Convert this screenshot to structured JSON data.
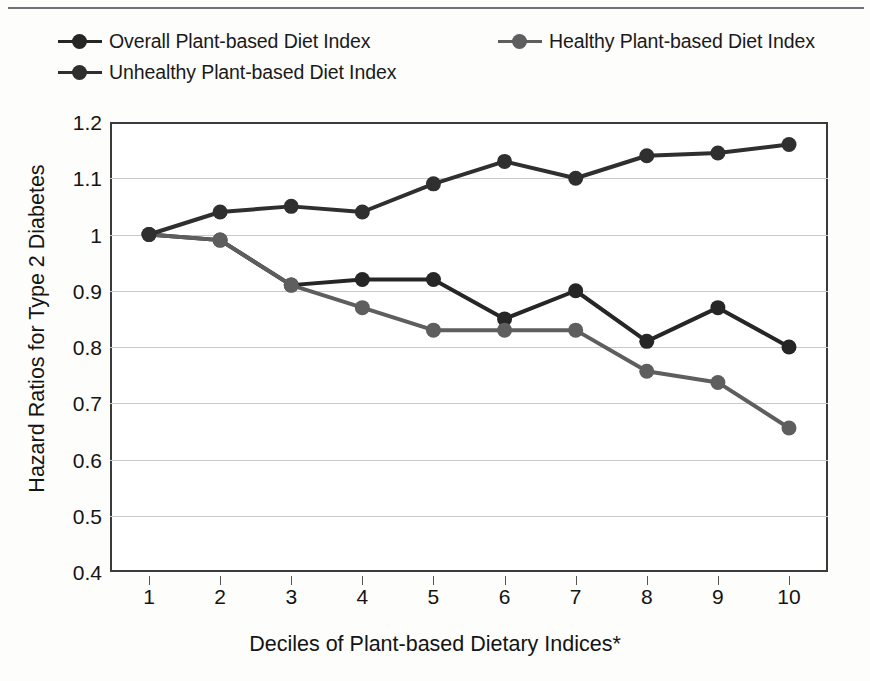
{
  "figure": {
    "has_top_rule": true,
    "background": "#fdfdfc"
  },
  "legend": {
    "items": [
      {
        "label": "Overall Plant-based Diet Index",
        "color": "#262626",
        "marker": "circle-marker-overall"
      },
      {
        "label": "Healthy Plant-based Diet Index",
        "color": "#5e5e5e",
        "marker": "circle-marker-healthy"
      },
      {
        "label": "Unhealthy Plant-based Diet Index",
        "color": "#2f2f2f",
        "marker": "circle-marker-unhealthy"
      }
    ]
  },
  "axes": {
    "y_ticks": [
      "1.2",
      "1.1",
      "1",
      "0.9",
      "0.8",
      "0.7",
      "0.6",
      "0.5",
      "0.4"
    ],
    "x_ticks": [
      "1",
      "2",
      "3",
      "4",
      "5",
      "6",
      "7",
      "8",
      "9",
      "10"
    ],
    "x_title": "Deciles of Plant-based Dietary Indices*",
    "y_title": "Hazard Ratios for Type 2 Diabetes"
  },
  "chart_data": {
    "type": "line",
    "title": "",
    "xlabel": "Deciles of Plant-based Dietary Indices*",
    "ylabel": "Hazard Ratios for Type 2 Diabetes",
    "x": [
      1,
      2,
      3,
      4,
      5,
      6,
      7,
      8,
      9,
      10
    ],
    "categories": [
      "1",
      "2",
      "3",
      "4",
      "5",
      "6",
      "7",
      "8",
      "9",
      "10"
    ],
    "xlim": [
      1,
      10
    ],
    "ylim": [
      0.4,
      1.2
    ],
    "y_ticks": [
      0.4,
      0.5,
      0.6,
      0.7,
      0.8,
      0.9,
      1.0,
      1.1,
      1.2
    ],
    "grid": "horizontal",
    "legend_position": "top",
    "series": [
      {
        "name": "Overall Plant-based Diet Index",
        "color": "#262626",
        "values": [
          1.0,
          0.99,
          0.91,
          0.92,
          0.92,
          0.85,
          0.9,
          0.81,
          0.87,
          0.8
        ]
      },
      {
        "name": "Healthy Plant-based Diet Index",
        "color": "#5e5e5e",
        "values": [
          1.0,
          0.99,
          0.91,
          0.87,
          0.83,
          0.83,
          0.83,
          0.757,
          0.737,
          0.656
        ]
      },
      {
        "name": "Unhealthy Plant-based Diet Index",
        "color": "#2f2f2f",
        "values": [
          1.0,
          1.04,
          1.05,
          1.04,
          1.09,
          1.13,
          1.1,
          1.14,
          1.145,
          1.16
        ]
      }
    ]
  }
}
